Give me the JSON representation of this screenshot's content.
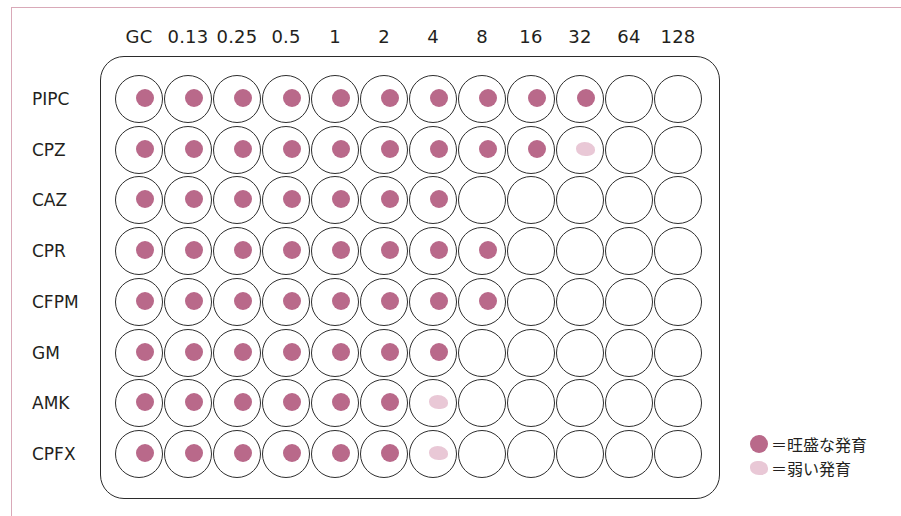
{
  "figure": {
    "columns": [
      "GC",
      "0.13",
      "0.25",
      "0.5",
      "1",
      "2",
      "4",
      "8",
      "16",
      "32",
      "64",
      "128"
    ],
    "rows": [
      {
        "label": "PIPC",
        "wells": [
          "S",
          "S",
          "S",
          "S",
          "S",
          "S",
          "S",
          "S",
          "S",
          "S",
          "-",
          "-"
        ]
      },
      {
        "label": "CPZ",
        "wells": [
          "S",
          "S",
          "S",
          "S",
          "S",
          "S",
          "S",
          "S",
          "S",
          "W",
          "-",
          "-"
        ]
      },
      {
        "label": "CAZ",
        "wells": [
          "S",
          "S",
          "S",
          "S",
          "S",
          "S",
          "S",
          "-",
          "-",
          "-",
          "-",
          "-"
        ]
      },
      {
        "label": "CPR",
        "wells": [
          "S",
          "S",
          "S",
          "S",
          "S",
          "S",
          "S",
          "S",
          "-",
          "-",
          "-",
          "-"
        ]
      },
      {
        "label": "CFPM",
        "wells": [
          "S",
          "S",
          "S",
          "S",
          "S",
          "S",
          "S",
          "S",
          "-",
          "-",
          "-",
          "-"
        ]
      },
      {
        "label": "GM",
        "wells": [
          "S",
          "S",
          "S",
          "S",
          "S",
          "S",
          "S",
          "-",
          "-",
          "-",
          "-",
          "-"
        ]
      },
      {
        "label": "AMK",
        "wells": [
          "S",
          "S",
          "S",
          "S",
          "S",
          "S",
          "W",
          "-",
          "-",
          "-",
          "-",
          "-"
        ]
      },
      {
        "label": "CPFX",
        "wells": [
          "S",
          "S",
          "S",
          "S",
          "S",
          "S",
          "W",
          "-",
          "-",
          "-",
          "-",
          "-"
        ]
      }
    ],
    "legend": [
      {
        "key": "S",
        "label": "＝旺盛な発育",
        "color": "#b9698a"
      },
      {
        "key": "W",
        "label": "＝弱い発育",
        "color": "#e9c8d6"
      }
    ]
  },
  "colors": {
    "strong_growth": "#b9698a",
    "weak_growth": "#e9c8d6",
    "frame": "#d9a9b8",
    "outline": "#2b2b2b"
  }
}
